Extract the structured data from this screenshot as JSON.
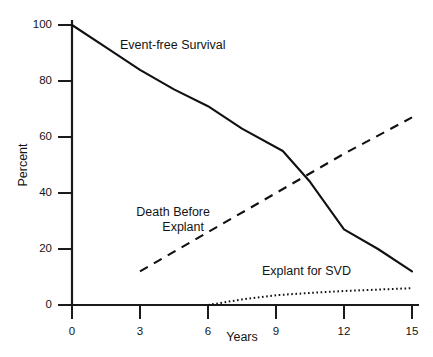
{
  "chart_data": {
    "type": "line",
    "title": "",
    "xlabel": "Years",
    "ylabel": "Percent",
    "xlim": [
      0,
      15
    ],
    "ylim": [
      0,
      100
    ],
    "xticks": [
      0,
      3,
      6,
      9,
      12,
      15
    ],
    "yticks": [
      0,
      20,
      40,
      60,
      80,
      100
    ],
    "xtick_labels": [
      "0",
      "3",
      "6",
      "9",
      "12",
      "15"
    ],
    "ytick_labels": [
      "0",
      "20",
      "40",
      "60",
      "80",
      "100"
    ],
    "grid": false,
    "legend_position": "inline-annotations",
    "series": [
      {
        "name": "Event-free Survival",
        "style": "solid",
        "color": "#111111",
        "x": [
          0,
          1.5,
          3,
          4.5,
          6,
          7.5,
          9.3,
          10.5,
          12,
          13.5,
          15
        ],
        "values": [
          100,
          92,
          84,
          77,
          71,
          63,
          55,
          44,
          27,
          20,
          12
        ]
      },
      {
        "name": "Death Before Explant",
        "style": "dashed",
        "color": "#111111",
        "x": [
          3,
          6,
          9,
          12,
          15
        ],
        "values": [
          12,
          26,
          40,
          54,
          67
        ]
      },
      {
        "name": "Explant for SVD",
        "style": "dotted",
        "color": "#111111",
        "x": [
          6,
          7.5,
          9,
          10.5,
          12,
          13.5,
          15
        ],
        "values": [
          0,
          2,
          3.5,
          4.3,
          5,
          5.5,
          6
        ]
      }
    ],
    "annotations": [
      {
        "name": "event-free-survival",
        "text": "Event-free Survival"
      },
      {
        "name": "death-before-explant",
        "text_line1": "Death Before",
        "text_line2": "Explant"
      },
      {
        "name": "explant-for-svd",
        "text": "Explant for SVD"
      }
    ]
  },
  "axes": {
    "ylabel": "Percent",
    "xlabel": "Years",
    "ytick_labels": [
      "100",
      "80",
      "60",
      "40",
      "20",
      "0"
    ],
    "xtick_labels": [
      "0",
      "3",
      "6",
      "9",
      "12",
      "15"
    ]
  },
  "labels": {
    "event_free_survival": "Event-free Survival",
    "death_before_explant_line1": "Death Before",
    "death_before_explant_line2": "Explant",
    "explant_for_svd": "Explant for SVD"
  },
  "colors": {
    "background": "#ffffff",
    "ink": "#111111",
    "axis": "#1a1a1a"
  }
}
